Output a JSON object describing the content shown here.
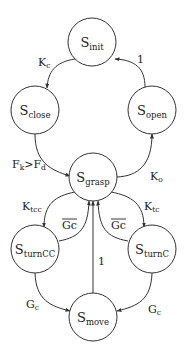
{
  "nodes": {
    "init": {
      "main": "S",
      "sub": "init"
    },
    "close": {
      "main": "S",
      "sub": "close"
    },
    "open": {
      "main": "S",
      "sub": "open"
    },
    "grasp": {
      "main": "S",
      "sub": "grasp"
    },
    "turncc": {
      "main": "S",
      "sub": "turnCC"
    },
    "turnc": {
      "main": "S",
      "sub": "turnC"
    },
    "move": {
      "main": "S",
      "sub": "move"
    }
  },
  "edges": {
    "init_to_close": {
      "main": "K",
      "sub": "c"
    },
    "open_to_init": {
      "main": "1"
    },
    "close_to_grasp": {
      "a": "F",
      "a_sub": "k",
      "op": ">",
      "b": "F",
      "b_sub": "d"
    },
    "grasp_to_open": {
      "main": "K",
      "sub": "o"
    },
    "grasp_to_turncc": {
      "main": "K",
      "sub": "tcc"
    },
    "grasp_to_turnc": {
      "main": "K",
      "sub": "tc"
    },
    "turncc_to_grasp": {
      "main": "Gc",
      "overline": true
    },
    "turnc_to_grasp": {
      "main": "Gc",
      "overline": true
    },
    "move_to_grasp": {
      "main": "1"
    },
    "turncc_to_move": {
      "main": "G",
      "sub": "c"
    },
    "turnc_to_move": {
      "main": "G",
      "sub": "c"
    }
  }
}
